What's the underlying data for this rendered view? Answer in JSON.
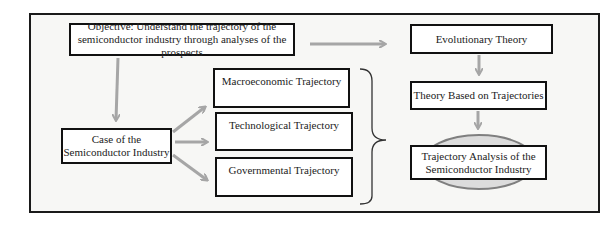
{
  "diagram": {
    "objective": "Objective: Understand the trajectory of the semiconductor industry through analyses of the prospects",
    "case": "Case of the Semiconductor Industry",
    "trajectories": [
      "Macroeconomic Trajectory",
      "Technological Trajectory",
      "Governmental Trajectory"
    ],
    "theory_chain": [
      "Evolutionary Theory",
      "Theory Based on Trajectories",
      "Trajectory Analysis of the Semiconductor Industry"
    ],
    "colors": {
      "arrow": "#a6a6a6",
      "border": "#111111",
      "ellipse": "#7f7f7f",
      "frame_bg": "#f7f7f5"
    }
  }
}
